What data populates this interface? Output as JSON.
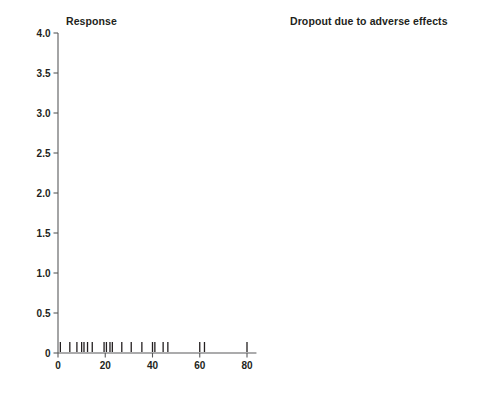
{
  "figure": {
    "ylabel": "Relative Risk",
    "xlabel_left": "Fluoxetine-equivalent dose (mg)",
    "xlabel_right": "Fluoxetine-equivalent dose (mg)",
    "colors": {
      "curve": "#6d6e71",
      "confidence_interval": "#8c8d8f",
      "axis": "#58595b",
      "text": "#231f20",
      "background": "#ffffff"
    }
  },
  "panels": [
    {
      "id": "response",
      "title": "Response"
    },
    {
      "id": "dropout",
      "title": "Dropout due to adverse effects"
    }
  ],
  "axes": {
    "y_ticks": [
      "0",
      "0.5",
      "1.0",
      "1.5",
      "2.0",
      "2.5",
      "3.0",
      "3.5",
      "4.0"
    ],
    "y_tick_values": [
      0,
      0.5,
      1.0,
      1.5,
      2.0,
      2.5,
      3.0,
      3.5,
      4.0
    ],
    "y_range": [
      0,
      4.0
    ],
    "x_ticks": [
      "0",
      "20",
      "40",
      "60",
      "80"
    ],
    "x_tick_values": [
      0,
      20,
      40,
      60,
      80
    ],
    "x_range": [
      0,
      84
    ]
  },
  "chart_data": {
    "type": "line",
    "xlabel": "Fluoxetine-equivalent dose (mg)",
    "ylabel": "Relative Risk",
    "xlim": [
      0,
      84
    ],
    "ylim": [
      0,
      4.0
    ],
    "grid": false,
    "legend": false,
    "panels": [
      {
        "name": "Response",
        "x": [
          2,
          5,
          10,
          15,
          20,
          25,
          30,
          35,
          40,
          45,
          50,
          55,
          60,
          65,
          70,
          75,
          80
        ],
        "series": [
          {
            "name": "Relative risk (point estimate)",
            "style": "solid",
            "values": [
              1.02,
              1.07,
              1.14,
              1.2,
              1.24,
              1.27,
              1.29,
              1.3,
              1.29,
              1.27,
              1.25,
              1.23,
              1.21,
              1.18,
              1.16,
              1.13,
              1.1
            ]
          },
          {
            "name": "Upper 95% confidence limit",
            "style": "dotted",
            "values": [
              1.03,
              1.09,
              1.17,
              1.25,
              1.3,
              1.34,
              1.36,
              1.37,
              1.37,
              1.36,
              1.35,
              1.35,
              1.34,
              1.33,
              1.32,
              1.31,
              1.3
            ]
          },
          {
            "name": "Lower 95% confidence limit",
            "style": "dotted",
            "values": [
              1.01,
              1.05,
              1.11,
              1.15,
              1.18,
              1.2,
              1.21,
              1.21,
              1.2,
              1.18,
              1.15,
              1.12,
              1.09,
              1.05,
              1.01,
              0.97,
              0.93
            ]
          }
        ],
        "rug_x": [
          1,
          5,
          8,
          10,
          11,
          12.5,
          14.5,
          19.5,
          20.5,
          22,
          23,
          27,
          31,
          35.5,
          40,
          41,
          44.5,
          46.5,
          60,
          62,
          80
        ]
      },
      {
        "name": "Dropout due to adverse effects",
        "x": [
          2,
          5,
          10,
          15,
          20,
          25,
          30,
          35,
          40,
          45,
          50,
          55,
          60,
          65,
          70,
          75,
          80
        ],
        "series": [
          {
            "name": "Relative risk (point estimate)",
            "style": "solid",
            "values": [
              1.0,
              1.06,
              1.17,
              1.3,
              1.44,
              1.59,
              1.76,
              1.94,
              2.13,
              2.33,
              2.54,
              2.75,
              2.97,
              3.17,
              3.36,
              3.52,
              3.65
            ]
          },
          {
            "name": "Upper 95% confidence limit",
            "style": "dotted",
            "values": [
              1.0,
              1.1,
              1.27,
              1.47,
              1.7,
              1.95,
              2.23,
              2.54,
              2.87,
              3.22,
              3.58,
              3.95,
              4.0,
              4.0,
              4.0,
              4.0,
              4.0
            ]
          },
          {
            "name": "Lower 95% confidence limit",
            "style": "dotted",
            "values": [
              1.0,
              1.0,
              1.03,
              1.09,
              1.17,
              1.26,
              1.36,
              1.47,
              1.58,
              1.7,
              1.82,
              1.94,
              2.05,
              2.15,
              2.24,
              2.3,
              2.34
            ]
          }
        ],
        "rug_x": [
          1,
          5,
          9,
          11,
          12,
          15,
          16,
          20,
          22,
          23,
          24,
          29,
          33,
          37,
          40,
          41,
          44,
          46,
          47,
          60,
          61.5
        ]
      }
    ]
  }
}
